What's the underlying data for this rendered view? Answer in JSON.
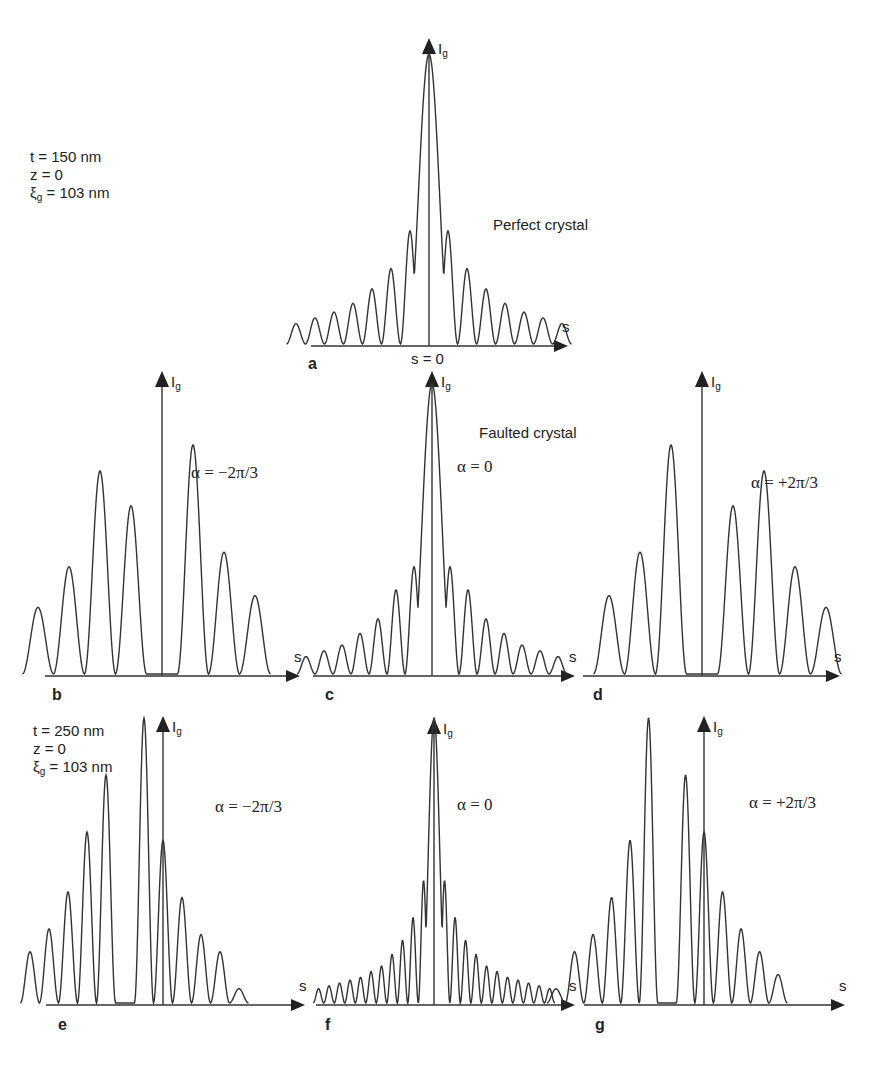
{
  "params_top": {
    "t": "t = 150 nm",
    "z": "z = 0",
    "xi_sym": "ξ",
    "xi_sub": "g",
    "xi_val": " = 103 nm"
  },
  "params_bottom": {
    "t": "t = 250 nm",
    "z": "z = 0",
    "xi_sym": "ξ",
    "xi_sub": "g",
    "xi_val": " = 103 nm"
  },
  "headings": {
    "perfect": "Perfect crystal",
    "faulted": "Faulted crystal",
    "s0": "s = 0"
  },
  "axis": {
    "y": "I",
    "y_sub": "g",
    "x": "s"
  },
  "panels": {
    "a": {
      "letter": "a",
      "alpha": ""
    },
    "b": {
      "letter": "b",
      "alpha": "α = −2π/3"
    },
    "c": {
      "letter": "c",
      "alpha": "α = 0"
    },
    "d": {
      "letter": "d",
      "alpha": "α = +2π/3"
    },
    "e": {
      "letter": "e",
      "alpha": "α = −2π/3"
    },
    "f": {
      "letter": "f",
      "alpha": "α = 0"
    },
    "g": {
      "letter": "g",
      "alpha": "α = +2π/3"
    }
  },
  "chart_data": [
    {
      "panel": "a",
      "type": "line",
      "title": "Perfect crystal",
      "subtitle": "t = 150 nm, z = 0, ξg = 103 nm",
      "xlabel": "s",
      "ylabel": "Ig",
      "x_annotation": "s = 0",
      "peaks_relative": {
        "positions": [
          -7,
          -6,
          -5,
          -4,
          -3,
          -2,
          -1,
          0,
          1,
          2,
          3,
          4,
          5,
          6,
          7
        ],
        "heights": [
          0.07,
          0.09,
          0.11,
          0.14,
          0.19,
          0.26,
          0.39,
          1.0,
          0.39,
          0.26,
          0.19,
          0.14,
          0.11,
          0.09,
          0.07
        ]
      }
    },
    {
      "panel": "b",
      "type": "line",
      "title": "Faulted crystal",
      "params": "t = 150 nm",
      "alpha": "-2π/3",
      "xlabel": "s",
      "ylabel": "Ig",
      "peaks_relative": {
        "positions": [
          -4,
          -3,
          -2,
          -1,
          1,
          2,
          3
        ],
        "heights": [
          0.23,
          0.37,
          0.7,
          0.58,
          0.79,
          0.42,
          0.27
        ]
      }
    },
    {
      "panel": "c",
      "type": "line",
      "title": "Faulted crystal",
      "params": "t = 150 nm",
      "alpha": "0",
      "xlabel": "s",
      "ylabel": "Ig",
      "peaks_relative": {
        "positions": [
          -7,
          -6,
          -5,
          -4,
          -3,
          -2,
          -1,
          0,
          1,
          2,
          3,
          4,
          5,
          6,
          7
        ],
        "heights": [
          0.06,
          0.08,
          0.1,
          0.14,
          0.19,
          0.29,
          0.37,
          1.0,
          0.37,
          0.29,
          0.19,
          0.14,
          0.1,
          0.08,
          0.06
        ]
      }
    },
    {
      "panel": "d",
      "type": "line",
      "title": "Faulted crystal",
      "params": "t = 150 nm",
      "alpha": "+2π/3",
      "xlabel": "s",
      "ylabel": "Ig",
      "peaks_relative": {
        "positions": [
          -3,
          -2,
          -1,
          1,
          2,
          3,
          4
        ],
        "heights": [
          0.27,
          0.42,
          0.79,
          0.58,
          0.7,
          0.37,
          0.23
        ]
      }
    },
    {
      "panel": "e",
      "type": "line",
      "params": "t = 250 nm, z = 0, ξg = 103 nm",
      "alpha": "-2π/3",
      "xlabel": "s",
      "ylabel": "Ig",
      "peaks_relative": {
        "positions": [
          -5,
          -4,
          -3,
          -2,
          -1,
          1,
          2,
          3,
          4,
          5,
          6
        ],
        "heights": [
          0.18,
          0.26,
          0.39,
          0.6,
          0.8,
          1.0,
          0.57,
          0.37,
          0.24,
          0.18,
          0.05
        ]
      }
    },
    {
      "panel": "f",
      "type": "line",
      "params": "t = 250 nm",
      "alpha": "0",
      "xlabel": "s",
      "ylabel": "Ig",
      "peaks_relative": {
        "positions": [
          -11,
          -10,
          -9,
          -8,
          -7,
          -6,
          -5,
          -4,
          -3,
          -2,
          -1,
          0,
          1,
          2,
          3,
          4,
          5,
          6,
          7,
          8,
          9,
          10,
          11
        ],
        "heights": [
          0.05,
          0.06,
          0.07,
          0.08,
          0.09,
          0.11,
          0.13,
          0.17,
          0.22,
          0.3,
          0.43,
          1.0,
          0.43,
          0.3,
          0.22,
          0.17,
          0.13,
          0.11,
          0.09,
          0.08,
          0.07,
          0.06,
          0.05
        ]
      }
    },
    {
      "panel": "g",
      "type": "line",
      "params": "t = 250 nm",
      "alpha": "+2π/3",
      "xlabel": "s",
      "ylabel": "Ig",
      "peaks_relative": {
        "positions": [
          -6,
          -5,
          -4,
          -3,
          -2,
          -1,
          1,
          2,
          3,
          4,
          5,
          6
        ],
        "heights": [
          0.05,
          0.18,
          0.24,
          0.37,
          0.57,
          1.0,
          0.8,
          0.6,
          0.39,
          0.26,
          0.18,
          0.1
        ]
      }
    }
  ]
}
